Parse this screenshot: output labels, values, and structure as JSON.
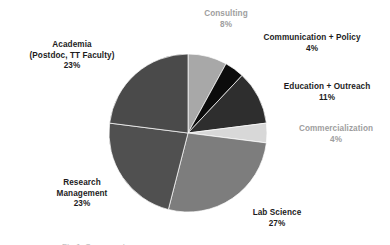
{
  "chart_data": {
    "type": "pie",
    "title": "",
    "subtitle": "",
    "xlabel": "",
    "ylabel": "",
    "legend_position": "none",
    "grid": false,
    "label_format": "name-and-percent",
    "start_angle_deg": 0,
    "direction": "clockwise",
    "total_percent": 100,
    "categories": [
      "Consulting",
      "Communication + Policy",
      "Education + Outreach",
      "Commercialization",
      "Lab Science",
      "Research Management",
      "Academia (Postdoc, TT Faculty)"
    ],
    "values": [
      8,
      4,
      11,
      4,
      27,
      23,
      23
    ],
    "slices": [
      {
        "key": "consulting",
        "name": "Consulting",
        "name_line1": "Consulting",
        "name_line2": "",
        "percent": 8,
        "percent_label": "8%",
        "color": "#a8a8a8",
        "label_color": "#9e9e9e",
        "start_angle_deg": 0,
        "end_angle_deg": 28.8
      },
      {
        "key": "communication-policy",
        "name": "Communication + Policy",
        "name_line1": "Communication + Policy",
        "name_line2": "",
        "percent": 4,
        "percent_label": "4%",
        "color": "#0c0c0c",
        "label_color": "#1c1c1c",
        "start_angle_deg": 28.8,
        "end_angle_deg": 43.2
      },
      {
        "key": "education-outreach",
        "name": "Education + Outreach",
        "name_line1": "Education + Outreach",
        "name_line2": "",
        "percent": 11,
        "percent_label": "11%",
        "color": "#2e2e2e",
        "label_color": "#1c1c1c",
        "start_angle_deg": 43.2,
        "end_angle_deg": 82.8
      },
      {
        "key": "commercialization",
        "name": "Commercialization",
        "name_line1": "Commercialization",
        "name_line2": "",
        "percent": 4,
        "percent_label": "4%",
        "color": "#d8d8d8",
        "label_color": "#9e9e9e",
        "start_angle_deg": 82.8,
        "end_angle_deg": 97.2
      },
      {
        "key": "lab-science",
        "name": "Lab Science",
        "name_line1": "Lab Science",
        "name_line2": "",
        "percent": 27,
        "percent_label": "27%",
        "color": "#7d7d7d",
        "label_color": "#1c1c1c",
        "start_angle_deg": 97.2,
        "end_angle_deg": 194.4
      },
      {
        "key": "research-management",
        "name": "Research Management",
        "name_line1": "Research",
        "name_line2": "Management",
        "percent": 23,
        "percent_label": "23%",
        "color": "#505050",
        "label_color": "#1c1c1c",
        "start_angle_deg": 194.4,
        "end_angle_deg": 277.2
      },
      {
        "key": "academia",
        "name": "Academia (Postdoc, TT Faculty)",
        "name_line1": "Academia",
        "name_line2": "(Postdoc, TT Faculty)",
        "percent": 23,
        "percent_label": "23%",
        "color": "#4a4a4a",
        "label_color": "#1c1c1c",
        "start_angle_deg": 277.2,
        "end_angle_deg": 360
      }
    ],
    "geometry": {
      "center_x": 188,
      "center_y": 133,
      "radius": 79
    },
    "background_color": "#ffffff"
  },
  "figure": {
    "bottom_artifact_text": "Fig 1. Career outcomes"
  }
}
